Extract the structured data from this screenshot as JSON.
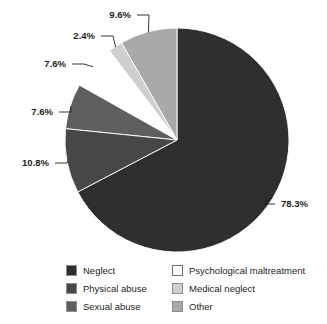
{
  "chart_data": {
    "type": "pie",
    "title": "",
    "subtitle": "",
    "xlabel": "",
    "ylabel": "",
    "legend_position": "bottom",
    "grid": false,
    "units": "percent",
    "categories": [
      "Neglect",
      "Physical abuse",
      "Sexual abuse",
      "Psychological maltreatment",
      "Medical neglect",
      "Other"
    ],
    "values": [
      78.3,
      10.8,
      7.6,
      7.6,
      2.4,
      9.6
    ],
    "value_labels": [
      "78.3%",
      "10.8%",
      "7.6%",
      "7.6%",
      "2.4%",
      "9.6%"
    ],
    "colors": [
      "#2f2f2f",
      "#474747",
      "#5e5e5e",
      "#ffffff",
      "#cfcfcf",
      "#a9a9a9"
    ],
    "slices": [
      {
        "label": "Neglect",
        "value": 78.3,
        "value_label": "78.3%",
        "color": "#2f2f2f",
        "label_x": 281,
        "label_y": 207,
        "anchor": "start"
      },
      {
        "label": "Physical abuse",
        "value": 10.8,
        "value_label": "10.8%",
        "color": "#474747",
        "label_x": 49,
        "label_y": 166,
        "anchor": "end"
      },
      {
        "label": "Sexual abuse",
        "value": 7.6,
        "value_label": "7.6%",
        "color": "#5e5e5e",
        "label_x": 53,
        "label_y": 115,
        "anchor": "end"
      },
      {
        "label": "Psychological maltreatment",
        "value": 7.6,
        "value_label": "7.6%",
        "color": "#ffffff",
        "label_x": 66,
        "label_y": 67,
        "anchor": "end"
      },
      {
        "label": "Medical neglect",
        "value": 2.4,
        "value_label": "2.4%",
        "color": "#cfcfcf",
        "label_x": 95,
        "label_y": 39,
        "anchor": "end"
      },
      {
        "label": "Other",
        "value": 9.6,
        "value_label": "9.6%",
        "color": "#a9a9a9",
        "label_x": 131,
        "label_y": 18,
        "anchor": "end"
      }
    ]
  },
  "legend": {
    "items": [
      {
        "label": "Neglect",
        "color": "#2f2f2f"
      },
      {
        "label": "Psychological maltreatment",
        "color": "#ffffff"
      },
      {
        "label": "Physical abuse",
        "color": "#474747"
      },
      {
        "label": "Medical neglect",
        "color": "#cfcfcf"
      },
      {
        "label": "Sexual abuse",
        "color": "#5e5e5e"
      },
      {
        "label": "Other",
        "color": "#a9a9a9"
      }
    ]
  }
}
